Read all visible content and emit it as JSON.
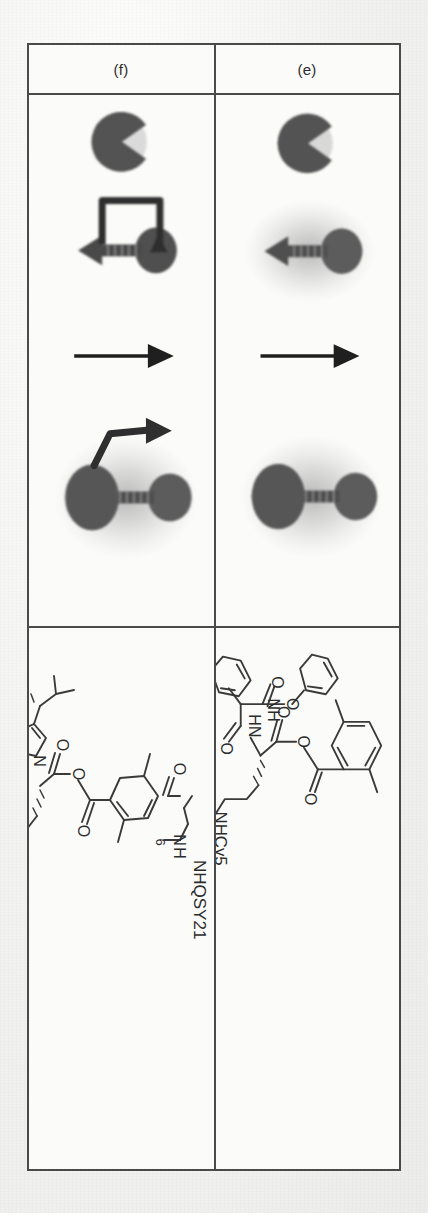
{
  "figure": {
    "caption_rows": [
      {
        "id": "row-e",
        "label": "(e)",
        "scheme": {
          "name": "fret-probe-cleavage-scheme",
          "stages": [
            {
              "name": "protease-enzyme",
              "shape": "pacman"
            },
            {
              "name": "quenched-probe-down-arrow",
              "glow": "on"
            },
            {
              "name": "transition-arrow",
              "direction": "up"
            },
            {
              "name": "cleaved-probe-pair",
              "glow": "on"
            }
          ]
        },
        "structure": {
          "name": "cy5-probe-dimethylbenzoate-ester",
          "labels": [
            "NHCy5",
            "O",
            "O",
            "O",
            "O",
            "N",
            "H",
            "N",
            "H",
            "O"
          ]
        }
      },
      {
        "id": "row-f",
        "label": "(f)",
        "scheme": {
          "name": "fret-probe-release-scheme",
          "stages": [
            {
              "name": "protease-enzyme",
              "shape": "pacman"
            },
            {
              "name": "quenched-probe-bound-arrow",
              "glow": "off"
            },
            {
              "name": "transition-arrow",
              "direction": "up"
            },
            {
              "name": "cleaved-probe-pair-with-release-arrow",
              "glow": "on"
            }
          ]
        },
        "structure": {
          "name": "cy5-qsy21-triazole-thiophene-probe",
          "labels": [
            "NHQSY21",
            "6",
            "N",
            "H",
            "O",
            "O",
            "O",
            "O",
            "N",
            "N",
            "N",
            "NH",
            "S",
            "NHCy5"
          ]
        }
      }
    ],
    "atom_labels": {
      "oxygen": "O",
      "nitrogen": "N",
      "hydrogen": "H",
      "sulfur": "S",
      "amine": "NH",
      "amide_nh": "HN"
    },
    "chain_labels": {
      "cy5": "NHCy5",
      "qsy21": "NHQSY21",
      "repeat_count": "6"
    },
    "colors": {
      "border": "#4a4a4a",
      "ink": "#2b2b2b",
      "structure_line": "#3a3a3a",
      "blob_fill": "#5c5c5c",
      "blob_fill_dark": "#4f4f4f",
      "glow": "#9a9a9a",
      "paper": "#fbfbfa",
      "page_background": "#f3f3f1"
    }
  }
}
